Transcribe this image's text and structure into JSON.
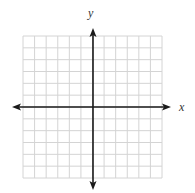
{
  "diagram": {
    "type": "coordinate-plane",
    "x_axis_label": "x",
    "y_axis_label": "y",
    "grid": {
      "columns": 12,
      "rows": 12,
      "left": 23,
      "top": 36,
      "right": 162,
      "bottom": 178,
      "line_color": "#d4d4d4"
    },
    "axes": {
      "origin_x": 93,
      "origin_y": 107,
      "x_min_px": 12,
      "x_max_px": 171,
      "y_min_px": 28,
      "y_max_px": 190,
      "color": "#1a1a1a"
    }
  }
}
